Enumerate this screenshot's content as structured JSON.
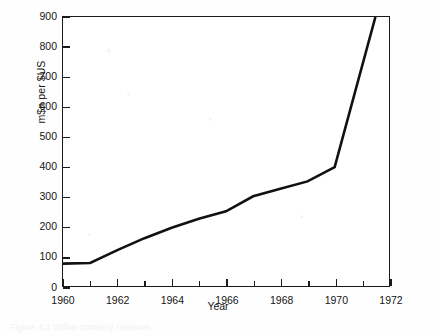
{
  "chart_data": {
    "type": "line",
    "title": "",
    "xlabel": "Year",
    "ylabel": "m$n per $US",
    "xlim": [
      1960,
      1972
    ],
    "ylim": [
      0,
      900
    ],
    "grid": false,
    "legend": "none",
    "x_ticks": [
      1960,
      1961,
      1962,
      1963,
      1964,
      1965,
      1966,
      1967,
      1968,
      1969,
      1970,
      1971,
      1972
    ],
    "x_tick_labels": [
      "1960",
      "",
      "1962",
      "",
      "1964",
      "",
      "1966",
      "",
      "1968",
      "",
      "1970",
      "",
      "1972"
    ],
    "y_ticks": [
      0,
      100,
      200,
      300,
      400,
      500,
      600,
      700,
      800,
      900
    ],
    "y_tick_labels": [
      "0",
      "100",
      "200",
      "300",
      "400",
      "500",
      "600",
      "700",
      "800",
      "900"
    ],
    "series": [
      {
        "name": "m$n per $US",
        "color": "#111111",
        "x": [
          1960,
          1961,
          1962,
          1963,
          1964,
          1965,
          1966,
          1967,
          1968,
          1969,
          1970,
          1971.5
        ],
        "values": [
          75,
          77,
          120,
          160,
          195,
          225,
          250,
          300,
          325,
          350,
          398,
          900
        ]
      }
    ]
  },
  "axes": {
    "y_label": "m$n per $US",
    "x_label": "Year"
  },
  "artifacts": {
    "caption_remnant": "Figure 4.1 Dollar currency reserves"
  }
}
